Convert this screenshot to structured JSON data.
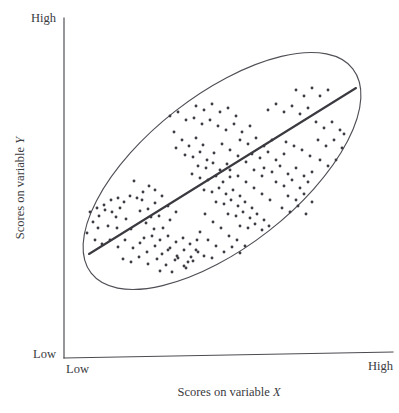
{
  "figure": {
    "type": "scatter-plot",
    "background_color": "#ffffff",
    "ink_color": "#3d3d44",
    "axis_color": "#4a4a50"
  },
  "axes": {
    "x": {
      "title": "Scores on variable ",
      "title_variable": "X",
      "low_label": "Low",
      "high_label": "High"
    },
    "y": {
      "title": "Scores on variable ",
      "title_variable": "Y",
      "low_label": "Low",
      "high_label": "High"
    }
  },
  "chart_data": {
    "type": "scatter",
    "title": "",
    "xlabel": "Scores on variable X",
    "ylabel": "Scores on variable Y",
    "xlim": [
      0,
      100
    ],
    "ylim": [
      0,
      100
    ],
    "xtick_labels": [
      "Low",
      "High"
    ],
    "ytick_labels": [
      "Low",
      "High"
    ],
    "grid": false,
    "legend": "none",
    "annotations": [
      {
        "name": "confidence-ellipse",
        "shape": "ellipse",
        "center": [
          222,
          171
        ],
        "radius_x": 166,
        "radius_y": 76,
        "rotation_deg": -38
      },
      {
        "name": "regression-line",
        "shape": "line",
        "x1": 89,
        "y1": 254,
        "x2": 356,
        "y2": 88
      }
    ],
    "point_radius": 1.45,
    "point_count": 214,
    "points": [
      [
        134,
        181
      ],
      [
        116,
        217
      ],
      [
        99,
        216
      ],
      [
        105,
        210
      ],
      [
        112,
        212
      ],
      [
        120,
        208
      ],
      [
        93,
        222
      ],
      [
        98,
        228
      ],
      [
        108,
        226
      ],
      [
        126,
        219
      ],
      [
        117,
        228
      ],
      [
        131,
        229
      ],
      [
        142,
        200
      ],
      [
        140,
        211
      ],
      [
        148,
        209
      ],
      [
        155,
        203
      ],
      [
        151,
        217
      ],
      [
        159,
        216
      ],
      [
        146,
        223
      ],
      [
        154,
        229
      ],
      [
        163,
        228
      ],
      [
        170,
        220
      ],
      [
        176,
        212
      ],
      [
        168,
        206
      ],
      [
        162,
        196
      ],
      [
        155,
        190
      ],
      [
        149,
        186
      ],
      [
        143,
        192
      ],
      [
        137,
        198
      ],
      [
        130,
        196
      ],
      [
        124,
        202
      ],
      [
        118,
        198
      ],
      [
        111,
        200
      ],
      [
        104,
        205
      ],
      [
        97,
        208
      ],
      [
        90,
        212
      ],
      [
        87,
        233
      ],
      [
        95,
        240
      ],
      [
        102,
        244
      ],
      [
        110,
        240
      ],
      [
        118,
        247
      ],
      [
        125,
        240
      ],
      [
        133,
        248
      ],
      [
        140,
        243
      ],
      [
        147,
        252
      ],
      [
        155,
        246
      ],
      [
        162,
        254
      ],
      [
        170,
        248
      ],
      [
        177,
        256
      ],
      [
        184,
        250
      ],
      [
        191,
        257
      ],
      [
        198,
        252
      ],
      [
        144,
        238
      ],
      [
        152,
        236
      ],
      [
        160,
        240
      ],
      [
        168,
        236
      ],
      [
        176,
        242
      ],
      [
        183,
        238
      ],
      [
        190,
        244
      ],
      [
        197,
        240
      ],
      [
        123,
        259
      ],
      [
        131,
        262
      ],
      [
        139,
        257
      ],
      [
        148,
        264
      ],
      [
        157,
        259
      ],
      [
        166,
        265
      ],
      [
        175,
        260
      ],
      [
        184,
        266
      ],
      [
        193,
        261
      ],
      [
        160,
        271
      ],
      [
        172,
        272
      ],
      [
        186,
        268
      ],
      [
        174,
        132
      ],
      [
        182,
        140
      ],
      [
        176,
        148
      ],
      [
        189,
        146
      ],
      [
        196,
        138
      ],
      [
        203,
        145
      ],
      [
        185,
        155
      ],
      [
        193,
        157
      ],
      [
        200,
        152
      ],
      [
        207,
        160
      ],
      [
        214,
        153
      ],
      [
        198,
        166
      ],
      [
        206,
        168
      ],
      [
        213,
        163
      ],
      [
        220,
        170
      ],
      [
        227,
        164
      ],
      [
        192,
        174
      ],
      [
        200,
        178
      ],
      [
        208,
        180
      ],
      [
        216,
        176
      ],
      [
        223,
        182
      ],
      [
        230,
        177
      ],
      [
        204,
        190
      ],
      [
        212,
        192
      ],
      [
        219,
        188
      ],
      [
        226,
        194
      ],
      [
        233,
        190
      ],
      [
        240,
        196
      ],
      [
        216,
        202
      ],
      [
        224,
        204
      ],
      [
        231,
        200
      ],
      [
        238,
        206
      ],
      [
        245,
        202
      ],
      [
        252,
        208
      ],
      [
        228,
        214
      ],
      [
        236,
        216
      ],
      [
        243,
        212
      ],
      [
        250,
        218
      ],
      [
        257,
        214
      ],
      [
        264,
        220
      ],
      [
        240,
        226
      ],
      [
        248,
        228
      ],
      [
        255,
        224
      ],
      [
        262,
        230
      ],
      [
        269,
        226
      ],
      [
        205,
        214
      ],
      [
        213,
        222
      ],
      [
        221,
        228
      ],
      [
        229,
        236
      ],
      [
        237,
        240
      ],
      [
        245,
        246
      ],
      [
        200,
        232
      ],
      [
        208,
        240
      ],
      [
        216,
        246
      ],
      [
        224,
        252
      ],
      [
        232,
        247
      ],
      [
        240,
        253
      ],
      [
        196,
        250
      ],
      [
        204,
        256
      ],
      [
        212,
        258
      ],
      [
        188,
        262
      ],
      [
        178,
        258
      ],
      [
        168,
        250
      ],
      [
        170,
        116
      ],
      [
        178,
        112
      ],
      [
        186,
        120
      ],
      [
        194,
        118
      ],
      [
        202,
        124
      ],
      [
        210,
        120
      ],
      [
        196,
        106
      ],
      [
        204,
        110
      ],
      [
        212,
        104
      ],
      [
        220,
        112
      ],
      [
        228,
        108
      ],
      [
        236,
        116
      ],
      [
        218,
        126
      ],
      [
        226,
        130
      ],
      [
        234,
        124
      ],
      [
        242,
        132
      ],
      [
        250,
        126
      ],
      [
        240,
        140
      ],
      [
        248,
        144
      ],
      [
        256,
        138
      ],
      [
        264,
        146
      ],
      [
        272,
        140
      ],
      [
        252,
        154
      ],
      [
        260,
        158
      ],
      [
        268,
        152
      ],
      [
        276,
        160
      ],
      [
        284,
        154
      ],
      [
        264,
        168
      ],
      [
        272,
        172
      ],
      [
        280,
        166
      ],
      [
        288,
        174
      ],
      [
        296,
        168
      ],
      [
        276,
        182
      ],
      [
        284,
        186
      ],
      [
        292,
        180
      ],
      [
        300,
        188
      ],
      [
        308,
        182
      ],
      [
        288,
        196
      ],
      [
        296,
        200
      ],
      [
        304,
        194
      ],
      [
        312,
        202
      ],
      [
        282,
        208
      ],
      [
        290,
        212
      ],
      [
        298,
        206
      ],
      [
        306,
        214
      ],
      [
        270,
        200
      ],
      [
        262,
        194
      ],
      [
        254,
        188
      ],
      [
        246,
        182
      ],
      [
        238,
        176
      ],
      [
        230,
        170
      ],
      [
        222,
        144
      ],
      [
        230,
        150
      ],
      [
        238,
        156
      ],
      [
        246,
        162
      ],
      [
        254,
        170
      ],
      [
        262,
        176
      ],
      [
        268,
        110
      ],
      [
        276,
        104
      ],
      [
        284,
        112
      ],
      [
        292,
        106
      ],
      [
        300,
        114
      ],
      [
        308,
        108
      ],
      [
        296,
        90
      ],
      [
        304,
        96
      ],
      [
        312,
        88
      ],
      [
        320,
        96
      ],
      [
        328,
        90
      ],
      [
        316,
        122
      ],
      [
        324,
        128
      ],
      [
        332,
        122
      ],
      [
        340,
        130
      ],
      [
        318,
        140
      ],
      [
        326,
        146
      ],
      [
        334,
        140
      ],
      [
        342,
        148
      ],
      [
        320,
        160
      ],
      [
        328,
        166
      ],
      [
        336,
        160
      ],
      [
        344,
        134
      ],
      [
        310,
        156
      ],
      [
        302,
        150
      ],
      [
        294,
        146
      ],
      [
        286,
        142
      ],
      [
        312,
        172
      ],
      [
        304,
        176
      ]
    ]
  }
}
